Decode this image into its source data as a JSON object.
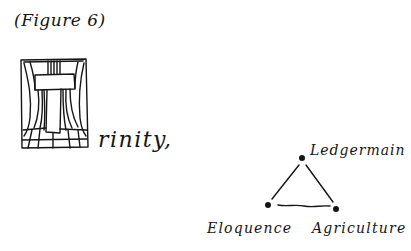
{
  "figure": {
    "caption": "(Figure 6)",
    "illuminated_letter": "T",
    "word_remainder": "rinity,",
    "full_word": "Trinity,"
  },
  "triangle": {
    "nodes": [
      {
        "id": "top",
        "label": "Ledgermain"
      },
      {
        "id": "bottom-left",
        "label": "Eloquence"
      },
      {
        "id": "bottom-right",
        "label": "Agriculture"
      }
    ]
  },
  "colors": {
    "ink": "#151515",
    "paper": "#ffffff"
  }
}
